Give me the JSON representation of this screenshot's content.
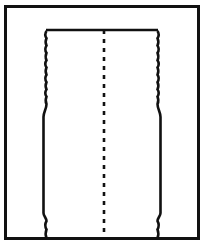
{
  "figure": {
    "domain": "Diagram",
    "kind": "technical-line-drawing",
    "canvas": {
      "width": 205,
      "height": 246,
      "background_color": "#FFFFFF",
      "ink_color": "#111111"
    },
    "frame": {
      "name": "outer-border",
      "x": 5.5,
      "y": 6.5,
      "width": 193,
      "height": 232,
      "stroke_color": "#111111",
      "stroke_width": 3,
      "fill": "none"
    },
    "centerline": {
      "name": "axis-of-symmetry",
      "orientation": "vertical",
      "x": 104,
      "y_top": 30,
      "y_bottom": 237,
      "style": "dashed",
      "stroke_color": "#111111",
      "stroke_width": 2.6,
      "dash_on": 4,
      "dash_off": 5
    },
    "profile": {
      "name": "sleeve-cross-section",
      "stroke_color": "#111111",
      "stroke_width": 2.6,
      "fill": "none",
      "symmetric": true,
      "top_rim_y": 30,
      "bottom_y": 238,
      "sections": [
        {
          "id": "top-rim",
          "label": "Top rim",
          "type": "horizontal-line",
          "y": 30,
          "x_left": 46,
          "x_right": 158
        },
        {
          "id": "threaded-wall",
          "label": "Threaded (serrated) wall",
          "type": "wavy-vertical",
          "y_start": 31,
          "y_end": 104,
          "x_left_mean": 46.5,
          "x_right_mean": 157.5,
          "wave_amplitude": 2.4,
          "wave_period": 7.3,
          "wave_count": 10
        },
        {
          "id": "shoulder",
          "label": "Outward shoulder / step",
          "type": "diagonal-step",
          "y_start": 104,
          "y_end": 117,
          "x_left_from": 46.5,
          "x_left_to": 43.5,
          "x_right_from": 157.5,
          "x_right_to": 160.5
        },
        {
          "id": "barrel-wall",
          "label": "Straight barrel wall",
          "type": "vertical-line",
          "y_start": 117,
          "y_end": 213,
          "x_left": 43.5,
          "x_right": 160.5
        },
        {
          "id": "lower-step",
          "label": "Lower inward step",
          "type": "diagonal-step",
          "y_start": 213,
          "y_end": 221,
          "x_left_from": 43.5,
          "x_left_to": 46.5,
          "x_right_from": 160.5,
          "x_right_to": 157.5
        },
        {
          "id": "foot-wall",
          "label": "Serrated foot wall",
          "type": "wavy-vertical",
          "y_start": 221,
          "y_end": 238,
          "x_left_mean": 46.5,
          "x_right_mean": 157.5,
          "wave_amplitude": 2.4,
          "wave_period": 7.3,
          "wave_count": 2
        }
      ]
    },
    "labels": {
      "figure_caption": "",
      "reference_numerals": [],
      "has_text": false,
      "note": "No textual labels, numerals, dimensions or legend are rendered anywhere in this figure."
    }
  }
}
